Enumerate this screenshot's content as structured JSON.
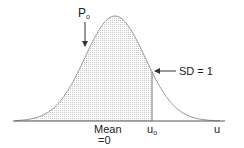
{
  "diagram": {
    "type": "normal-distribution-curve",
    "labels": {
      "p_main": "P",
      "p_sub": "o",
      "sd": "SD = 1",
      "mean_line1": "Mean",
      "mean_line2": "=0",
      "u0_main": "u",
      "u0_sub": "o",
      "axis": "u"
    },
    "colors": {
      "curve": "#9a9a9a",
      "axis": "#555555",
      "shade_dot": "#c8c8c8",
      "text": "#222222",
      "arrow": "#333333"
    },
    "geometry": {
      "baseline_y": 121,
      "axis_x_start": 13,
      "axis_x_end": 225,
      "mean_x": 115,
      "peak_y": 16,
      "sigma_px": 30,
      "u0_x": 152
    }
  },
  "chart_data": {
    "type": "area",
    "title": "",
    "xlabel": "u",
    "ylabel": "",
    "mean": 0,
    "sd": 1,
    "shaded_region": {
      "from": "-inf",
      "to": "u_o"
    },
    "annotations": [
      "P_o",
      "SD = 1",
      "Mean =0",
      "u_o",
      "u"
    ]
  }
}
